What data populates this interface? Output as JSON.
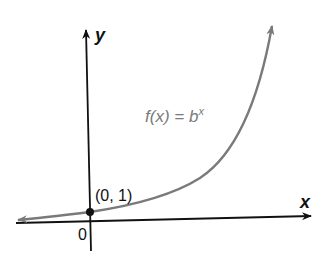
{
  "diagram": {
    "axes": {
      "x_label": "x",
      "y_label": "y",
      "origin_label": "0"
    },
    "curve": {
      "function_prefix": "f(x) = b",
      "function_exponent": "x",
      "color": "#7a7a7a"
    },
    "point": {
      "label": "(0, 1)",
      "color": "#111111"
    },
    "colors": {
      "axis": "#111111",
      "curve": "#7a7a7a",
      "background": "#ffffff"
    }
  }
}
